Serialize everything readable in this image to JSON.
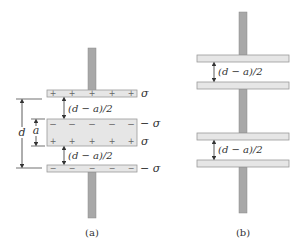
{
  "figure": {
    "panel_a": {
      "caption": "(a)",
      "top_plate": {
        "charge_label": "σ",
        "signs": [
          "+",
          "+",
          "+",
          "+",
          "+"
        ]
      },
      "gap_upper_label": "(d − a)/2",
      "slab": {
        "top_charge_label": "− σ",
        "bottom_charge_label": "σ",
        "top_signs": [
          "−",
          "−",
          "−",
          "−",
          "−"
        ],
        "bottom_signs": [
          "+",
          "+",
          "+",
          "+",
          "+"
        ]
      },
      "gap_lower_label": "(d − a)/2",
      "bottom_plate": {
        "charge_label": "− σ",
        "signs": [
          "−",
          "−",
          "−",
          "−",
          "−"
        ]
      },
      "dimension_d_label": "d",
      "dimension_a_label": "a"
    },
    "panel_b": {
      "caption": "(b)",
      "gap_upper_label": "(d − a)/2",
      "gap_lower_label": "(d − a)/2"
    },
    "colors": {
      "plate_fill": "#e6e6e6",
      "plate_stroke": "#9a9a9a",
      "rod_fill": "#a8a8a8",
      "line": "#333333"
    }
  }
}
